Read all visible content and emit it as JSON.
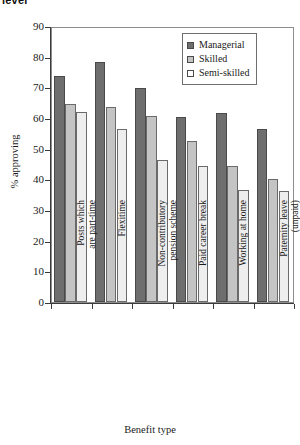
{
  "caption_fragment": "level",
  "chart_data": {
    "type": "bar",
    "title": "",
    "xlabel": "Benefit type",
    "ylabel": "% approving",
    "ylim": [
      0,
      90
    ],
    "ytick_step": 10,
    "yticks": [
      0,
      10,
      20,
      30,
      40,
      50,
      60,
      70,
      80,
      90
    ],
    "grid": false,
    "legend_position": "top-right",
    "categories": [
      "Posts which\nare part-time",
      "Flexitime",
      "Non-contributory\npension scheme",
      "Paid career break",
      "Working at home",
      "Paternity leave\n(unpaid)"
    ],
    "series": [
      {
        "name": "Managerial",
        "color": "#6e6e6e",
        "values": [
          73.7,
          78.2,
          69.8,
          60.4,
          61.6,
          56.5
        ]
      },
      {
        "name": "Skilled",
        "color": "#c4c4c4",
        "values": [
          64.7,
          63.6,
          60.6,
          52.5,
          44.2,
          40.1
        ]
      },
      {
        "name": "Semi-skilled",
        "color": "#eeeeee",
        "values": [
          62.1,
          56.3,
          46.3,
          44.3,
          36.5,
          36.3
        ]
      }
    ]
  }
}
